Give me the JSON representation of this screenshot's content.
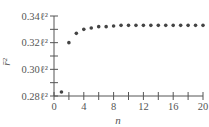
{
  "chart_data": {
    "type": "scatter",
    "title": "",
    "xlabel": "n",
    "ylabel": "r̄²",
    "xlim": [
      0,
      20
    ],
    "ylim": [
      0.28,
      0.34
    ],
    "x_ticks": [
      0,
      4,
      8,
      12,
      16,
      20
    ],
    "x_tick_labels": [
      "0",
      "4",
      "8",
      "12",
      "16",
      "20"
    ],
    "y_ticks": [
      0.28,
      0.3,
      0.32,
      0.34
    ],
    "y_tick_labels": [
      "0.28ℓ²",
      "0.30ℓ²",
      "0.32ℓ²",
      "0.34ℓ²"
    ],
    "y_minor_step": 0.01,
    "x_minor_step": 2,
    "grid": false,
    "legend": null,
    "series": [
      {
        "name": "r̄²",
        "x": [
          1,
          2,
          3,
          4,
          5,
          6,
          7,
          8,
          9,
          10,
          11,
          12,
          13,
          14,
          15,
          16,
          17,
          18,
          19,
          20
        ],
        "values": [
          0.283,
          0.32,
          0.327,
          0.33,
          0.331,
          0.332,
          0.332,
          0.3325,
          0.333,
          0.333,
          0.333,
          0.333,
          0.333,
          0.333,
          0.333,
          0.333,
          0.333,
          0.333,
          0.333,
          0.333
        ]
      }
    ],
    "colors": {
      "points": "#444444",
      "axis": "#555555"
    }
  }
}
